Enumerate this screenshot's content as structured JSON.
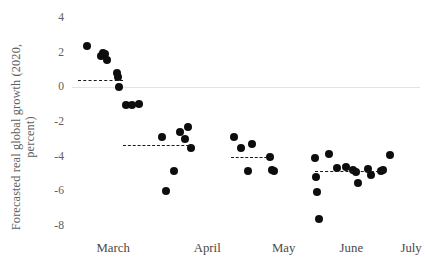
{
  "chart_data": {
    "type": "scatter",
    "title": "",
    "xlabel": "",
    "ylabel": "Forecasted real global growth (2020, percent)",
    "ylabel_line1": "Forecasted real global growth (2020,",
    "ylabel_line2": "percent)",
    "ylim": [
      -8,
      4
    ],
    "yticks": [
      4,
      2,
      0,
      -2,
      -4,
      -6,
      -8
    ],
    "ytick_labels": [
      "4",
      "2",
      "0",
      "-2",
      "-4",
      "-6",
      "-8"
    ],
    "xtick_labels": [
      "March",
      "April",
      "May",
      "June",
      "July"
    ],
    "grid": false,
    "zero_line": 0,
    "legend": "none",
    "marker": "filled-circle",
    "marker_color": "#0d0d0d",
    "points": [
      {
        "x": 0.1,
        "y": 2.4
      },
      {
        "x": 0.26,
        "y": 1.8
      },
      {
        "x": 0.29,
        "y": 2.0
      },
      {
        "x": 0.31,
        "y": 1.9
      },
      {
        "x": 0.33,
        "y": 1.6
      },
      {
        "x": 0.44,
        "y": 0.8
      },
      {
        "x": 0.45,
        "y": 0.6
      },
      {
        "x": 0.47,
        "y": 0.0
      },
      {
        "x": 0.55,
        "y": -1.0
      },
      {
        "x": 0.61,
        "y": -1.0
      },
      {
        "x": 0.69,
        "y": -0.95
      },
      {
        "x": 0.95,
        "y": -2.85
      },
      {
        "x": 1.0,
        "y": -6.0
      },
      {
        "x": 1.09,
        "y": -4.8
      },
      {
        "x": 1.16,
        "y": -2.6
      },
      {
        "x": 1.22,
        "y": -3.0
      },
      {
        "x": 1.25,
        "y": -2.3
      },
      {
        "x": 1.29,
        "y": -3.5
      },
      {
        "x": 1.78,
        "y": -2.85
      },
      {
        "x": 1.85,
        "y": -3.5
      },
      {
        "x": 1.93,
        "y": -4.8
      },
      {
        "x": 1.98,
        "y": -3.25
      },
      {
        "x": 2.18,
        "y": -4.0
      },
      {
        "x": 2.21,
        "y": -4.75
      },
      {
        "x": 2.23,
        "y": -4.85
      },
      {
        "x": 2.7,
        "y": -4.1
      },
      {
        "x": 2.71,
        "y": -5.2
      },
      {
        "x": 2.72,
        "y": -6.05
      },
      {
        "x": 2.74,
        "y": -7.6
      },
      {
        "x": 2.85,
        "y": -3.85
      },
      {
        "x": 2.95,
        "y": -4.65
      },
      {
        "x": 3.05,
        "y": -4.6
      },
      {
        "x": 3.13,
        "y": -4.75
      },
      {
        "x": 3.16,
        "y": -4.9
      },
      {
        "x": 3.18,
        "y": -5.5
      },
      {
        "x": 3.3,
        "y": -4.7
      },
      {
        "x": 3.33,
        "y": -5.05
      },
      {
        "x": 3.45,
        "y": -4.8
      },
      {
        "x": 3.47,
        "y": -4.75
      },
      {
        "x": 3.55,
        "y": -3.9
      }
    ],
    "mean_segments": [
      {
        "label": "March mean",
        "x_start": 0.0,
        "x_end": 0.51,
        "value": 0.4
      },
      {
        "label": "April mean",
        "x_start": 0.51,
        "x_end": 1.32,
        "value": -3.35
      },
      {
        "label": "May mean",
        "x_start": 1.74,
        "x_end": 2.21,
        "value": -4.0
      },
      {
        "label": "June-July mean",
        "x_start": 2.7,
        "x_end": 3.48,
        "value": -4.8
      }
    ]
  }
}
